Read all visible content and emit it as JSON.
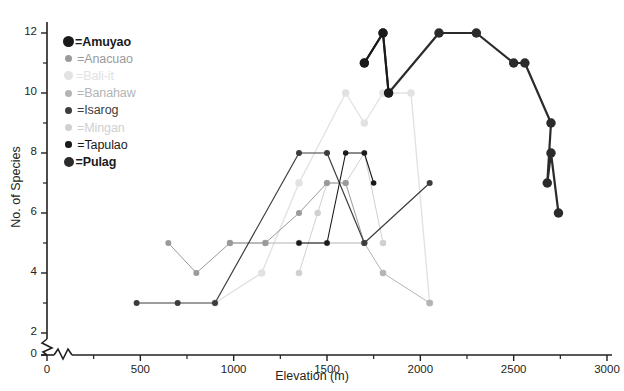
{
  "chart_data": {
    "type": "line",
    "title": "",
    "xlabel": "Elevation (m)",
    "ylabel": "No. of Species",
    "xlim": [
      0,
      3000
    ],
    "ylim": [
      0,
      12.6
    ],
    "y_axis_break": {
      "between": [
        0,
        2
      ],
      "style": "zigzag"
    },
    "x_major_ticks": [
      0,
      500,
      1000,
      1500,
      2000,
      2500,
      3000
    ],
    "x_minor_ticks": [
      250,
      750,
      1250,
      1750,
      2250,
      2750
    ],
    "y_major_ticks": [
      0,
      2,
      4,
      6,
      8,
      10,
      12
    ],
    "y_minor_ticks": [
      3,
      5,
      7,
      9,
      11
    ],
    "grid": false,
    "legend_position": "top-left",
    "markers": "filled-circle",
    "series": [
      {
        "name": "Amuyao",
        "color": "#1a1a1a",
        "marker_size": 9,
        "line_width": 2.0,
        "x": [
          1700,
          1800,
          1830
        ],
        "y": [
          11,
          12,
          10
        ]
      },
      {
        "name": "Anacuao",
        "color": "#9a9a9a",
        "marker_size": 6,
        "line_width": 1.0,
        "x": [
          650,
          800,
          980,
          1170,
          1350,
          1500,
          1600,
          1700
        ],
        "y": [
          5,
          4,
          5,
          5,
          6,
          7,
          7,
          5
        ]
      },
      {
        "name": "Bali-it",
        "color": "#e2e2e2",
        "marker_size": 7.5,
        "line_width": 1.4,
        "x": [
          900,
          1150,
          1350,
          1600,
          1700,
          1800,
          1950,
          2050
        ],
        "y": [
          3,
          4,
          7,
          10,
          9,
          10,
          10,
          3
        ]
      },
      {
        "name": "Banahaw",
        "color": "#b4b4b4",
        "marker_size": 6.5,
        "line_width": 1.0,
        "x": [
          980,
          1170,
          1350,
          1500,
          1700,
          1800,
          2050
        ],
        "y": [
          5,
          5,
          5,
          5,
          5,
          4,
          3
        ]
      },
      {
        "name": "Isarog",
        "color": "#3d3d3d",
        "marker_size": 6,
        "line_width": 1.2,
        "x": [
          480,
          700,
          900,
          1350,
          1500,
          1700,
          2050
        ],
        "y": [
          3,
          3,
          3,
          8,
          8,
          5,
          7
        ]
      },
      {
        "name": "Mingan",
        "color": "#d0d0d0",
        "marker_size": 6.5,
        "line_width": 1.0,
        "x": [
          1350,
          1450,
          1500,
          1600,
          1700,
          1800
        ],
        "y": [
          4,
          6,
          7,
          7,
          8,
          5
        ]
      },
      {
        "name": "Tapulao",
        "color": "#1a1a1a",
        "marker_size": 5.5,
        "line_width": 1.1,
        "x": [
          1350,
          1500,
          1600,
          1700,
          1750
        ],
        "y": [
          5,
          5,
          8,
          8,
          7
        ]
      },
      {
        "name": "Pulag",
        "color": "#2b2b2b",
        "marker_size": 9.5,
        "line_width": 2.2,
        "x": [
          1700,
          1800,
          1830,
          2100,
          2300,
          2500,
          2560,
          2700,
          2680,
          2700,
          2740
        ],
        "y": [
          11,
          12,
          10,
          12,
          12,
          11,
          11,
          9,
          7,
          8,
          6
        ]
      }
    ]
  },
  "legend": {
    "items": [
      {
        "label": "=Amuyao",
        "series": "Amuyao",
        "color": "#1a1a1a",
        "size": 11,
        "bold": true
      },
      {
        "label": "=Anacuao",
        "series": "Anacuao",
        "color": "#9a9a9a",
        "size": 7,
        "bold": false
      },
      {
        "label": "=Bali-it",
        "series": "Bali-it",
        "color": "#e2e2e2",
        "size": 9,
        "bold": false
      },
      {
        "label": "=Banahaw",
        "series": "Banahaw",
        "color": "#b4b4b4",
        "size": 7,
        "bold": false
      },
      {
        "label": "=Isarog",
        "series": "Isarog",
        "color": "#3d3d3d",
        "size": 7,
        "bold": false
      },
      {
        "label": "=Mingan",
        "series": "Mingan",
        "color": "#d0d0d0",
        "size": 7,
        "bold": false
      },
      {
        "label": "=Tapulao",
        "series": "Tapulao",
        "color": "#1a1a1a",
        "size": 6.5,
        "bold": false
      },
      {
        "label": "=Pulag",
        "series": "Pulag",
        "color": "#2b2b2b",
        "size": 10,
        "bold": true
      }
    ]
  },
  "axes": {
    "x_title": "Elevation (m)",
    "y_title": "No. of Species",
    "x_tick_labels": [
      "0",
      "500",
      "1000",
      "1500",
      "2000",
      "2500",
      "3000"
    ],
    "y_tick_labels": [
      "0",
      "2",
      "4",
      "6",
      "8",
      "10",
      "12"
    ]
  }
}
